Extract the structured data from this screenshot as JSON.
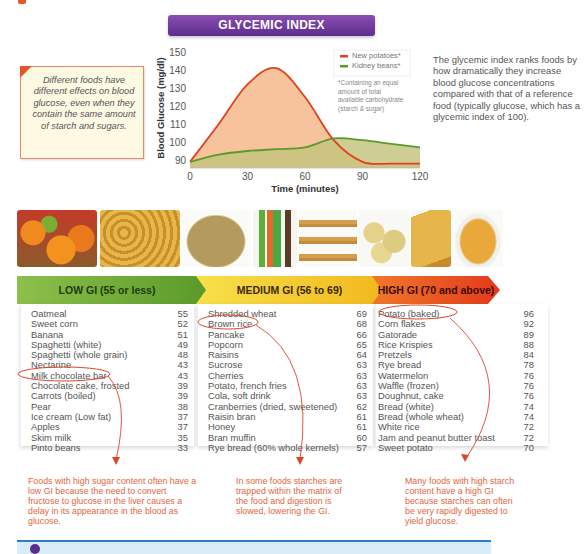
{
  "title": "GLYCEMIC INDEX",
  "note_box": {
    "text": "Different foods have different effects on blood glucose, even when they contain the same amount of starch and sugars."
  },
  "side_text": "The glycemic index ranks foods by how dramatically they increase blood glucose concentrations compared with that of a reference food (typically glucose, which has a glycemic index of 100).",
  "chart_data": {
    "type": "area",
    "title": "GLYCEMIC INDEX",
    "xlabel": "Time (minutes)",
    "ylabel": "Blood Glucose (mg/dl)",
    "x_ticks": [
      0,
      30,
      60,
      90,
      120
    ],
    "y_ticks": [
      90,
      100,
      110,
      120,
      130,
      140,
      150
    ],
    "xlim": [
      0,
      120
    ],
    "ylim": [
      85,
      152
    ],
    "x": [
      0,
      15,
      30,
      45,
      60,
      75,
      90,
      105,
      120
    ],
    "series": [
      {
        "name": "New potatoes*",
        "color": "#e0401e",
        "fill": "#f5bc92",
        "values": [
          89,
          110,
          132,
          141,
          125,
          101,
          89,
          88,
          88
        ]
      },
      {
        "name": "Kidney beans*",
        "color": "#5a9a2a",
        "fill": "#cfe3a6",
        "values": [
          89,
          93,
          95,
          96,
          97,
          102,
          101,
          99,
          97
        ]
      }
    ],
    "legend_position": "top-right",
    "legend_note": "*Containing an equal amount of total available carbohydrate (starch & sugar)",
    "grid": false
  },
  "photos": [
    "fruits",
    "pasta",
    "brown-rice",
    "soft-drinks",
    "pancakes",
    "potatoes",
    "bread",
    "cereal"
  ],
  "gi_categories": [
    {
      "label": "LOW GI (55 or less)",
      "color": "#6aa936",
      "items": [
        {
          "food": "Oatmeal",
          "gi": "55"
        },
        {
          "food": "Sweet corn",
          "gi": "52"
        },
        {
          "food": "Banana",
          "gi": "51"
        },
        {
          "food": "Spaghetti (white)",
          "gi": "49"
        },
        {
          "food": "Spaghetti (whole grain)",
          "gi": "48"
        },
        {
          "food": "Nectarine",
          "gi": "43"
        },
        {
          "food": "Milk chocolate bar",
          "gi": "43"
        },
        {
          "food": "Chocolate cake, frosted",
          "gi": "39"
        },
        {
          "food": "Carrots (boiled)",
          "gi": "39"
        },
        {
          "food": "Pear",
          "gi": "38"
        },
        {
          "food": "Ice cream (Low fat)",
          "gi": "37"
        },
        {
          "food": "Apples",
          "gi": "37"
        },
        {
          "food": "Skim milk",
          "gi": "35"
        },
        {
          "food": "Pinto beans",
          "gi": "33"
        }
      ],
      "circled": "Milk chocolate bar",
      "annotation": "Foods with high sugar content often have a low GI because the need to convert fructose to glucose in the liver causes a delay in its appearance in the blood as glucose."
    },
    {
      "label": "MEDIUM GI (56 to 69)",
      "color": "#f5c52a",
      "items": [
        {
          "food": "Shredded wheat",
          "gi": "69"
        },
        {
          "food": "Brown rice",
          "gi": "68"
        },
        {
          "food": "Pancake",
          "gi": "66"
        },
        {
          "food": "Popcorn",
          "gi": "65"
        },
        {
          "food": "Raisins",
          "gi": "64"
        },
        {
          "food": "Sucrose",
          "gi": "63"
        },
        {
          "food": "Cherries",
          "gi": "63"
        },
        {
          "food": "Potato, french fries",
          "gi": "63"
        },
        {
          "food": "Cola, soft drink",
          "gi": "63"
        },
        {
          "food": "Cranberries (dried, sweetened)",
          "gi": "62"
        },
        {
          "food": "Raisin bran",
          "gi": "61"
        },
        {
          "food": "Honey",
          "gi": "61"
        },
        {
          "food": "Bran muffin",
          "gi": "60"
        },
        {
          "food": "Rye bread (60% whole kernels)",
          "gi": "57"
        }
      ],
      "circled": "Brown rice",
      "annotation": "In some foods starches are trapped within the matrix of the food and digestion is slowed, lowering the GI."
    },
    {
      "label": "HIGH GI (70 and above)",
      "color": "#ec5a22",
      "items": [
        {
          "food": "Potato (baked)",
          "gi": "96"
        },
        {
          "food": "Corn flakes",
          "gi": "92"
        },
        {
          "food": "Gatorade",
          "gi": "89"
        },
        {
          "food": "Rice Krispies",
          "gi": "88"
        },
        {
          "food": "Pretzels",
          "gi": "84"
        },
        {
          "food": "Rye bread",
          "gi": "78"
        },
        {
          "food": "Watermelon",
          "gi": "76"
        },
        {
          "food": "Waffle (frozen)",
          "gi": "76"
        },
        {
          "food": "Doughnut, cake",
          "gi": "76"
        },
        {
          "food": "Bread (white)",
          "gi": "74"
        },
        {
          "food": "Bread (whole wheat)",
          "gi": "74"
        },
        {
          "food": "White rice",
          "gi": "72"
        },
        {
          "food": "Jam and peanut butter toast",
          "gi": "72"
        },
        {
          "food": "Sweet potato",
          "gi": "70"
        }
      ],
      "circled": "Potato (baked)",
      "annotation": "Many foods with high starch content have a high GI because starches can often be very rapidly digested to yield glucose."
    }
  ]
}
